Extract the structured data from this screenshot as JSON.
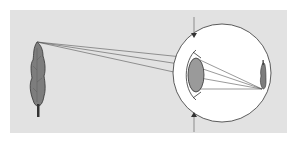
{
  "diagram": {
    "title": "",
    "colors": {
      "background": "#ffffff",
      "panel": "#e2e2e2",
      "eyeball": "#ffffff",
      "lens": "#9a9a9a",
      "outline": "#333333",
      "rays": "#555555",
      "tree": "#7d7d7d"
    },
    "elements": [
      {
        "name": "object-tree",
        "label": ""
      },
      {
        "name": "light-rays",
        "label": ""
      },
      {
        "name": "eyeball",
        "label": ""
      },
      {
        "name": "cornea",
        "label": ""
      },
      {
        "name": "lens",
        "label": ""
      },
      {
        "name": "retinal-image",
        "label": ""
      },
      {
        "name": "arrow-top",
        "label": ""
      },
      {
        "name": "arrow-bottom",
        "label": ""
      }
    ]
  }
}
